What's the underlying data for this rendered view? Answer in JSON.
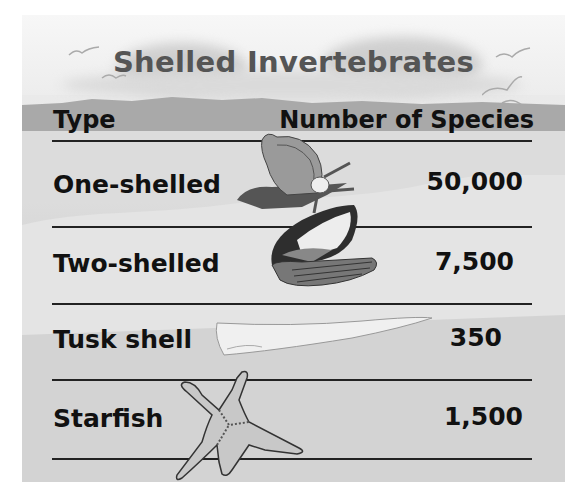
{
  "title": "Shelled Invertebrates",
  "table": {
    "headers": [
      "Type",
      "Number of Species"
    ],
    "rows": [
      {
        "type": "One-shelled",
        "species": "50,000",
        "illustration": "snail-icon"
      },
      {
        "type": "Two-shelled",
        "species": "7,500",
        "illustration": "clam-icon"
      },
      {
        "type": "Tusk shell",
        "species": "350",
        "illustration": "tusk-shell-icon"
      },
      {
        "type": "Starfish",
        "species": "1,500",
        "illustration": "starfish-icon"
      }
    ]
  },
  "decorations": [
    "seagull-icon",
    "clouds",
    "mountains",
    "beach"
  ],
  "colors": {
    "title": "#555555",
    "text": "#111111",
    "background": "#d9d9d9"
  }
}
